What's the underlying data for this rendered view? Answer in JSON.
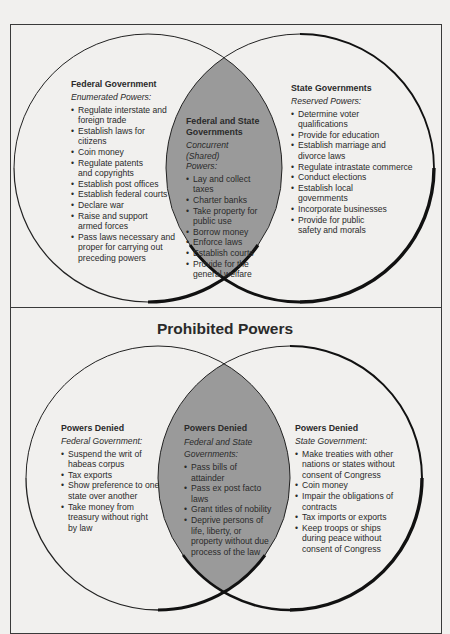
{
  "top_diagram": {
    "left": {
      "heading": "Federal Government",
      "subheading": "Enumerated Powers:",
      "items": [
        "Regulate interstate and foreign trade",
        "Establish laws for citizens",
        "Coin money",
        "Regulate patents and copyrights",
        "Establish post offices",
        "Establish federal courts",
        "Declare war",
        "Raise and support armed forces",
        "Pass laws necessary and proper for carrying out preceding powers"
      ]
    },
    "center": {
      "heading": "Federal and State Governments",
      "subheading": "Concurrent (Shared) Powers:",
      "items": [
        "Lay and collect taxes",
        "Charter banks",
        "Take property for public use",
        "Borrow money",
        "Enforce laws",
        "Establish courts",
        "Provide for the general welfare"
      ]
    },
    "right": {
      "heading": "State Governments",
      "subheading": "Reserved Powers:",
      "items": [
        "Determine voter qualifications",
        "Provide for education",
        "Establish marriage and divorce laws",
        "Regulate intrastate commerce",
        "Conduct elections",
        "Establish local governments",
        "Incorporate businesses",
        "Provide for public safety and morals"
      ]
    }
  },
  "bottom_diagram": {
    "title": "Prohibited Powers",
    "left": {
      "heading": "Powers Denied",
      "subheading": "Federal Government:",
      "items": [
        "Suspend the writ of habeas corpus",
        "Tax exports",
        "Show preference to one state over another",
        "Take money from treasury without right by law"
      ]
    },
    "center": {
      "heading": "Powers Denied",
      "subheading": "Federal and State Governments:",
      "items": [
        "Pass bills of attainder",
        "Pass ex post facto laws",
        "Grant titles of nobility",
        "Deprive persons of life, liberty, or property without due process of the law"
      ]
    },
    "right": {
      "heading": "Powers Denied",
      "subheading": "State Government:",
      "items": [
        "Make treaties with other nations or states without consent of Congress",
        "Coin money",
        "Impair the obligations of contracts",
        "Tax imports or exports",
        "Keep troops or ships during peace without consent of Congress"
      ]
    }
  },
  "colors": {
    "background": "#f1f0ee",
    "intersection": "#9a9a9a",
    "outline": "#1a1a1a"
  }
}
